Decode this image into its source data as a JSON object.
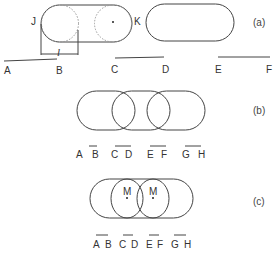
{
  "panels": {
    "a": {
      "label": "(a)",
      "left_shape_labels": {
        "left_end": "J",
        "right_end": "K",
        "length": "l"
      },
      "segments": [
        {
          "start": "A",
          "end": "B"
        },
        {
          "start": "C",
          "end": "D"
        },
        {
          "start": "E",
          "end": "F"
        }
      ]
    },
    "b": {
      "label": "(b)",
      "segments": [
        {
          "start": "A",
          "end": "B"
        },
        {
          "start": "C",
          "end": "D"
        },
        {
          "start": "E",
          "end": "F"
        },
        {
          "start": "G",
          "end": "H"
        }
      ]
    },
    "c": {
      "label": "(c)",
      "midpoint_labels": [
        "M",
        "M"
      ],
      "segments": [
        {
          "start": "A",
          "end": "B"
        },
        {
          "start": "C",
          "end": "D"
        },
        {
          "start": "E",
          "end": "F"
        },
        {
          "start": "G",
          "end": "H"
        }
      ]
    }
  }
}
